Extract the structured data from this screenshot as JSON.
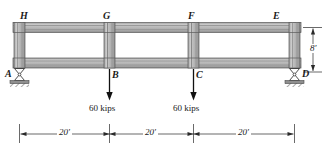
{
  "figure": {
    "type": "structural-frame-diagram"
  },
  "joints": {
    "top": [
      {
        "key": "H",
        "label": "H",
        "x": 22,
        "y": 14
      },
      {
        "key": "G",
        "label": "G",
        "x": 104,
        "y": 14
      },
      {
        "key": "F",
        "label": "F",
        "x": 188,
        "y": 14
      },
      {
        "key": "E",
        "label": "E",
        "x": 272,
        "y": 14
      }
    ],
    "bottom": [
      {
        "key": "A",
        "label": "A",
        "x": 8,
        "y": 70
      },
      {
        "key": "B",
        "label": "B",
        "x": 114,
        "y": 70
      },
      {
        "key": "C",
        "label": "C",
        "x": 198,
        "y": 70
      },
      {
        "key": "D",
        "label": "D",
        "x": 302,
        "y": 70
      }
    ]
  },
  "loads": [
    {
      "id": "load-b",
      "magnitude": "60 kips",
      "at_joint": "B",
      "direction": "down",
      "x": 110
    },
    {
      "id": "load-c",
      "magnitude": "60 kips",
      "at_joint": "C",
      "direction": "down",
      "x": 194
    }
  ],
  "dimensions": {
    "height": {
      "label": "8'",
      "value": 8,
      "unit": "ft"
    },
    "spans": [
      {
        "label": "20'",
        "value": 20,
        "unit": "ft"
      },
      {
        "label": "20'",
        "value": 20,
        "unit": "ft"
      },
      {
        "label": "20'",
        "value": 20,
        "unit": "ft"
      }
    ]
  },
  "supports": [
    {
      "id": "support-a",
      "at_joint": "A",
      "type": "rocker"
    },
    {
      "id": "support-d",
      "at_joint": "D",
      "type": "rocker"
    }
  ],
  "colors": {
    "member_fill": "#b4b4b4",
    "member_fill_light": "#c8c8c8",
    "member_fill_dark": "#8c8c8c",
    "outline": "#4a4a4a",
    "ink": "#1a1a1a",
    "ground": "#9a9a9a"
  }
}
